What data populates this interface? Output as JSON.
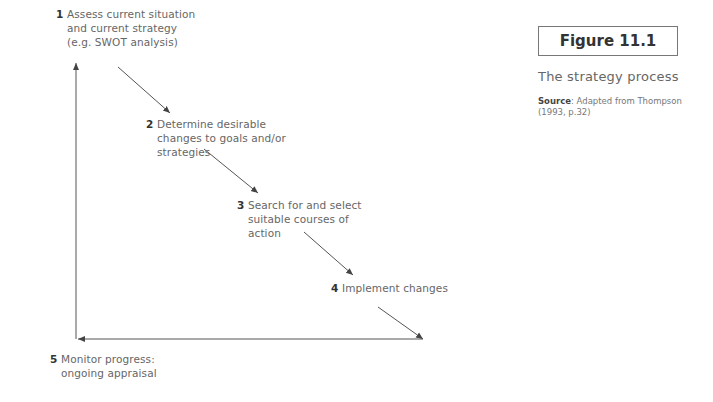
{
  "figure": {
    "label": "Figure 11.1",
    "title": "The strategy process",
    "source_label": "Source",
    "source_text": ": Adapted from Thompson (1993, p.32)"
  },
  "steps": [
    {
      "num": "1",
      "lines": [
        "Assess current situation",
        "and current strategy",
        "(e.g. SWOT analysis)"
      ]
    },
    {
      "num": "2",
      "lines": [
        "Determine desirable",
        "changes to goals and/or",
        "strategies"
      ]
    },
    {
      "num": "3",
      "lines": [
        "Search for and select",
        "suitable courses of",
        "action"
      ]
    },
    {
      "num": "4",
      "lines": [
        "Implement changes"
      ]
    },
    {
      "num": "5",
      "lines": [
        "Monitor progress:",
        "ongoing appraisal"
      ]
    }
  ],
  "colors": {
    "line": "#444444",
    "text": "#666666",
    "number": "#333333"
  }
}
